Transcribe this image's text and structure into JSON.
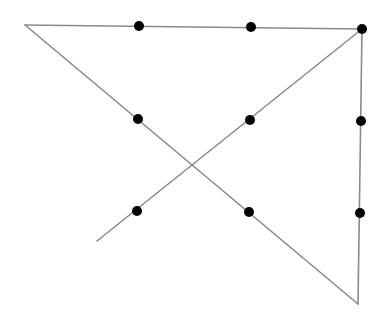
{
  "diagram": {
    "width": 390,
    "height": 312,
    "line_color": "#8a8a8a",
    "line_width": 1.6,
    "dot_color": "#000000",
    "dot_radius": 5,
    "dots": [
      {
        "x": 139,
        "y": 26
      },
      {
        "x": 251,
        "y": 27
      },
      {
        "x": 362,
        "y": 29
      },
      {
        "x": 138,
        "y": 119
      },
      {
        "x": 250,
        "y": 120
      },
      {
        "x": 361,
        "y": 121
      },
      {
        "x": 137,
        "y": 211
      },
      {
        "x": 249,
        "y": 212
      },
      {
        "x": 360,
        "y": 213
      }
    ],
    "lines": [
      {
        "x1": 25,
        "y1": 25,
        "x2": 362,
        "y2": 29
      },
      {
        "x1": 362,
        "y1": 29,
        "x2": 358,
        "y2": 304
      },
      {
        "x1": 25,
        "y1": 25,
        "x2": 358,
        "y2": 304
      },
      {
        "x1": 362,
        "y1": 29,
        "x2": 97,
        "y2": 241
      }
    ]
  }
}
